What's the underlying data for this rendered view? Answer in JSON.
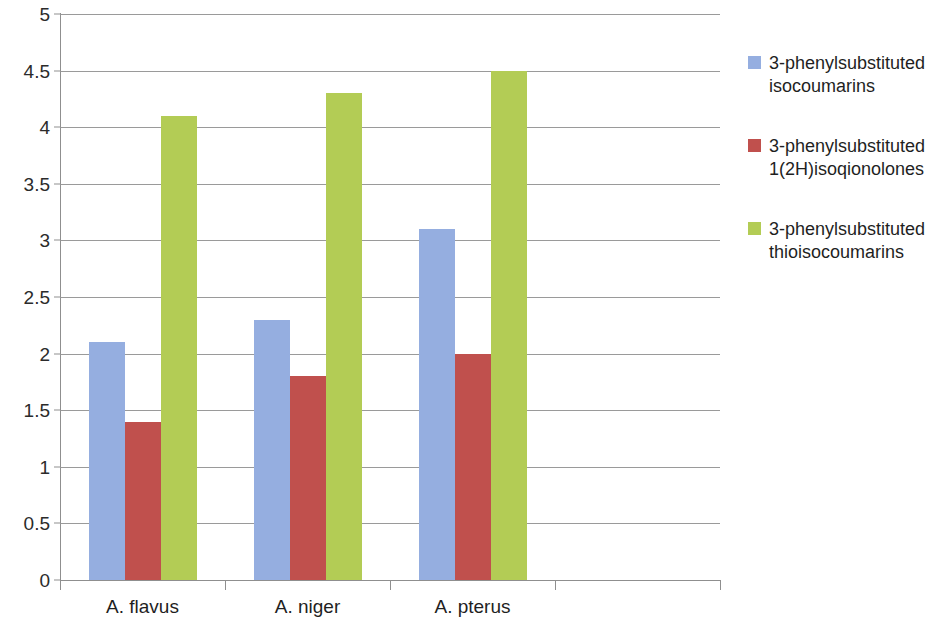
{
  "chart_data": {
    "type": "bar",
    "title": "",
    "xlabel": "",
    "ylabel": "",
    "ylim": [
      0,
      5
    ],
    "ytick_step": 0.5,
    "grid": true,
    "legend_position": "right",
    "categories": [
      "A. flavus",
      "A. niger",
      "A. pterus",
      ""
    ],
    "ytick_labels": [
      "5",
      "4.5",
      "4",
      "3.5",
      "3",
      "2.5",
      "2",
      "1.5",
      "1",
      "0.5",
      "0"
    ],
    "ytick_values": [
      5,
      4.5,
      4,
      3.5,
      3,
      2.5,
      2,
      1.5,
      1,
      0.5,
      0
    ],
    "series": [
      {
        "name": "3-phenylsubstituted isocoumarins",
        "legend_label": "3-phenylsubstituted\nisocoumarins",
        "color": "#95AEE0",
        "values": [
          2.1,
          2.3,
          3.1,
          null
        ]
      },
      {
        "name": "3-phenylsubstituted 1(2H)isoqionolones",
        "legend_label": "3-phenylsubstituted\n1(2H)isoqionolones",
        "color": "#C0504D",
        "values": [
          1.4,
          1.8,
          2.0,
          null
        ]
      },
      {
        "name": "3-phenylsubstituted thioisocoumarins",
        "legend_label": "3-phenylsubstituted\nthioisocoumarins",
        "color": "#B3CC55",
        "values": [
          4.1,
          4.3,
          4.5,
          null
        ]
      }
    ]
  },
  "axis": {
    "grid_color": "#9a9a9a",
    "axis_color": "#8f8f8f"
  }
}
